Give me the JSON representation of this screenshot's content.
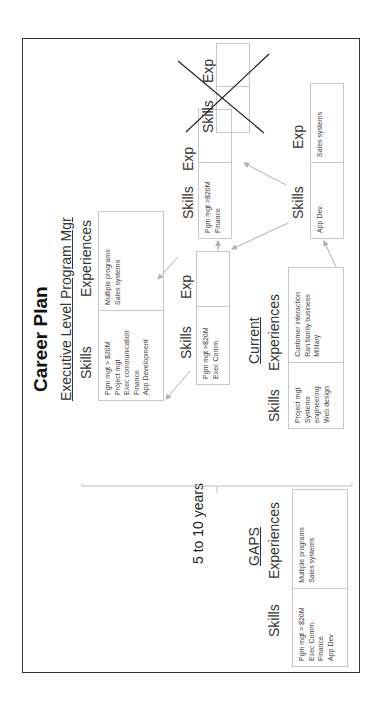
{
  "title": "Career Plan",
  "timeframe_label": "5 to 10 years",
  "sections": {
    "executive": {
      "heading": "Executive Level Program Mgr",
      "skills_label": "Skills",
      "experiences_label": "Experiences",
      "skills": [
        "Pgm mgt > $20M",
        "Project mgt",
        "Exec communication",
        "Finance",
        "App Development"
      ],
      "experiences": [
        "Multiple programs",
        "Sales systems"
      ]
    },
    "current": {
      "heading": "Current",
      "skills_label": "Skills",
      "experiences_label": "Experiences",
      "skills": [
        "Project mgt",
        "Systems",
        "engineering",
        "Web design"
      ],
      "experiences": [
        "Customer interaction",
        "Ran family business",
        "Military"
      ]
    },
    "gaps": {
      "heading": "GAPS",
      "skills_label": "Skills",
      "experiences_label": "Experiences",
      "skills": [
        "Pgm mgt > $20M",
        "Exec Comm.",
        "Finance",
        "App Dev"
      ],
      "experiences": [
        "Multiple programs",
        "Sales systems"
      ]
    }
  },
  "steps": [
    {
      "id": "step-a",
      "skills_label": "Skills",
      "exp_label": "Exp",
      "skills": [
        "Pgm mgt >$20M",
        "Exec Comm."
      ],
      "experiences": []
    },
    {
      "id": "step-b",
      "skills_label": "Skills",
      "exp_label": "Exp",
      "skills": [
        "Pgm mgt >$20M",
        "Finance"
      ],
      "experiences": []
    },
    {
      "id": "step-c",
      "skills_label": "Skills",
      "exp_label": "Exp",
      "skills": [
        "App Dev."
      ],
      "experiences": [
        "Sales systems"
      ]
    },
    {
      "id": "step-d-crossed-out",
      "skills_label": "Skills",
      "exp_label": "Exp",
      "skills": [],
      "experiences": [],
      "crossed_out": true
    }
  ],
  "colors": {
    "frame": "#333333",
    "box_border": "#c8c8c8",
    "arrow": "#b0b0b0",
    "cross": "#222222"
  }
}
